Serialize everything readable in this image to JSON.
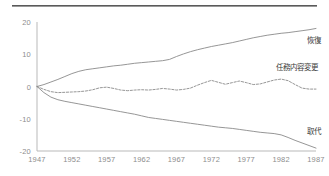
{
  "page": {
    "background_color": "#ffffff",
    "rule_color": "#4a4a4a",
    "axis_color": "#b9b9b9",
    "line_color": "#8a8a8a",
    "tick_text_color": "#8d8d8d",
    "label_text_color": "#3b3b3b"
  },
  "chart_data": {
    "type": "line",
    "title": "",
    "subtitle": "",
    "xlabel": "",
    "ylabel": "",
    "xlim": [
      1947,
      1987
    ],
    "ylim": [
      -20,
      20
    ],
    "grid": false,
    "legend_position": "right-inline",
    "x_ticks": [
      "1947",
      "1952",
      "1957",
      "1962",
      "1967",
      "1972",
      "1977",
      "1982",
      "1987"
    ],
    "y_ticks": [
      "20",
      "10",
      "0",
      "-10",
      "-20"
    ],
    "x": [
      1947,
      1948,
      1949,
      1950,
      1951,
      1952,
      1953,
      1954,
      1955,
      1956,
      1957,
      1958,
      1959,
      1960,
      1961,
      1962,
      1963,
      1964,
      1965,
      1966,
      1967,
      1968,
      1969,
      1970,
      1971,
      1972,
      1973,
      1974,
      1975,
      1976,
      1977,
      1978,
      1979,
      1980,
      1981,
      1982,
      1983,
      1984,
      1985,
      1986,
      1987
    ],
    "series": [
      {
        "name": "恢復",
        "label": "恢復",
        "style": "solid",
        "color": "#8a8a8a",
        "label_x": 1988.2,
        "label_y": 14.6,
        "values": [
          0.0,
          0.6,
          1.4,
          2.2,
          3.1,
          4.0,
          4.7,
          5.2,
          5.5,
          5.8,
          6.1,
          6.4,
          6.6,
          6.9,
          7.2,
          7.4,
          7.6,
          7.8,
          8.0,
          8.4,
          9.3,
          10.1,
          10.8,
          11.4,
          11.9,
          12.4,
          12.8,
          13.2,
          13.6,
          14.1,
          14.6,
          15.1,
          15.5,
          15.9,
          16.2,
          16.5,
          16.7,
          17.0,
          17.3,
          17.6,
          18.0
        ]
      },
      {
        "name": "任務内容変更",
        "label": "任務内容変更",
        "style": "dashed",
        "color": "#8a8a8a",
        "label_x": 1985.6,
        "label_y": 6.4,
        "values": [
          0.0,
          -0.9,
          -1.6,
          -1.9,
          -1.8,
          -1.7,
          -1.6,
          -1.4,
          -1.0,
          -0.4,
          -0.2,
          -0.6,
          -1.1,
          -1.3,
          -1.1,
          -1.0,
          -1.1,
          -0.9,
          -0.6,
          -0.8,
          -1.1,
          -0.9,
          -0.5,
          0.4,
          1.2,
          1.9,
          1.3,
          0.7,
          1.2,
          1.7,
          1.2,
          0.6,
          0.8,
          1.4,
          2.0,
          2.3,
          1.8,
          0.6,
          -0.5,
          -0.8,
          -0.8
        ]
      },
      {
        "name": "取代",
        "label": "取代",
        "style": "solid",
        "color": "#8a8a8a",
        "label_x": 1988.2,
        "label_y": -13.4,
        "values": [
          0.0,
          -1.9,
          -3.3,
          -4.1,
          -4.6,
          -5.0,
          -5.4,
          -5.8,
          -6.2,
          -6.6,
          -7.0,
          -7.4,
          -7.8,
          -8.2,
          -8.6,
          -9.1,
          -9.6,
          -9.9,
          -10.2,
          -10.5,
          -10.8,
          -11.1,
          -11.4,
          -11.7,
          -12.0,
          -12.3,
          -12.6,
          -12.8,
          -13.0,
          -13.3,
          -13.6,
          -13.9,
          -14.2,
          -14.4,
          -14.6,
          -15.0,
          -15.8,
          -16.7,
          -17.5,
          -18.3,
          -19.1
        ]
      }
    ]
  }
}
